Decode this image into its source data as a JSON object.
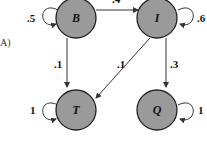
{
  "panel_label": "A)",
  "nodes": {
    "B": {
      "label": "B"
    },
    "I": {
      "label": "I"
    },
    "T": {
      "label": "T"
    },
    "Q": {
      "label": "Q"
    }
  },
  "edges": {
    "B_B": ".5",
    "B_I": ".4",
    "I_I": ".6",
    "B_T": ".1",
    "I_T": ".1",
    "I_Q": ".3",
    "T_T": "1",
    "Q_Q": "1"
  },
  "colors": {
    "node_fill": "#9a9a9a",
    "stroke": "#222222"
  }
}
